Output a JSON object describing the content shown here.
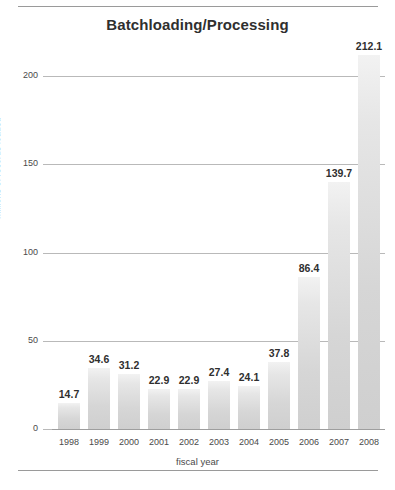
{
  "figure": {
    "ghost_header": "",
    "title": "Batchloading/Processing"
  },
  "chart_data": {
    "type": "bar",
    "title": "Batchloading/Processing",
    "xlabel": "fiscal year",
    "ylabel": "millions of records loaded",
    "categories": [
      "1998",
      "1999",
      "2000",
      "2001",
      "2002",
      "2003",
      "2004",
      "2005",
      "2006",
      "2007",
      "2008"
    ],
    "values": [
      14.7,
      34.6,
      31.2,
      22.9,
      22.9,
      27.4,
      24.1,
      37.8,
      86.4,
      139.7,
      212.1
    ],
    "value_labels": [
      "14.7",
      "34.6",
      "31.2",
      "22.9",
      "22.9",
      "27.4",
      "24.1",
      "37.8",
      "86.4",
      "139.7",
      "212.1"
    ],
    "ylim": [
      0,
      215
    ],
    "yticks": [
      0,
      50,
      100,
      150,
      200
    ],
    "ytick_labels": [
      "0",
      "50",
      "100",
      "150",
      "200"
    ],
    "grid": true,
    "grid_axis": "y",
    "legend": false,
    "bar_color": "#dcdcdc",
    "bar_edge_color": "#c9c9c9",
    "text_color": "#2f2f2f",
    "grid_color": "#b9b9b9",
    "background": "#ffffff"
  }
}
